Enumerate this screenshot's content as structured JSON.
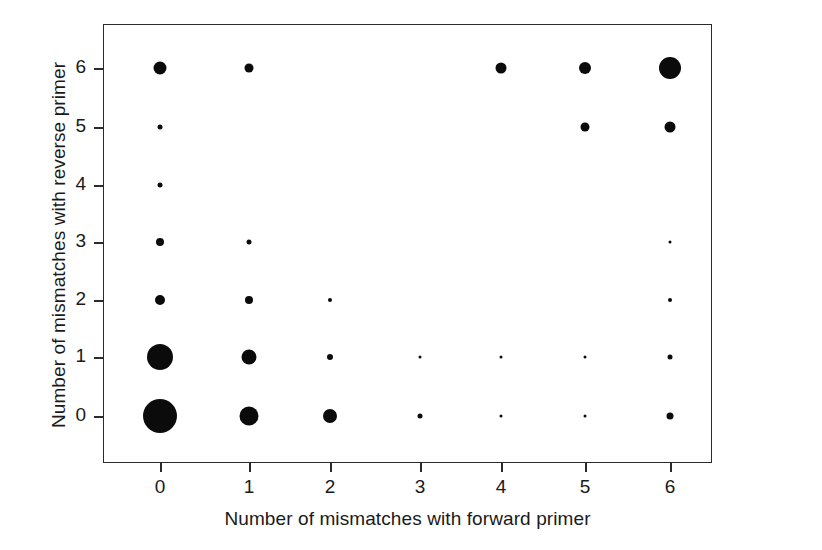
{
  "chart_data": {
    "type": "scatter",
    "title": "",
    "xlabel": "Number of mismatches with forward primer",
    "ylabel": "Number of mismatches with reverse primer",
    "xticks": [
      "0",
      "1",
      "2",
      "3",
      "4",
      "5",
      "6"
    ],
    "yticks": [
      "0",
      "1",
      "2",
      "3",
      "4",
      "5",
      "6"
    ],
    "xlim": [
      -0.65,
      6.45
    ],
    "ylim": [
      -0.75,
      6.6
    ],
    "grid": false,
    "legend": null,
    "marker_color": "#0b0b0b",
    "frame_color": "#2b2b2b",
    "background": "#ffffff",
    "encoding": "marker area proportional to count of sequences at each (forward, reverse) mismatch pair",
    "points": [
      {
        "x": 0,
        "y": 0,
        "size": 34
      },
      {
        "x": 0,
        "y": 1,
        "size": 26
      },
      {
        "x": 0,
        "y": 2,
        "size": 10
      },
      {
        "x": 0,
        "y": 3,
        "size": 8
      },
      {
        "x": 0,
        "y": 4,
        "size": 5
      },
      {
        "x": 0,
        "y": 5,
        "size": 5
      },
      {
        "x": 0,
        "y": 6,
        "size": 13
      },
      {
        "x": 1,
        "y": 0,
        "size": 19
      },
      {
        "x": 1,
        "y": 1,
        "size": 15
      },
      {
        "x": 1,
        "y": 2,
        "size": 8
      },
      {
        "x": 1,
        "y": 3,
        "size": 5
      },
      {
        "x": 1,
        "y": 6,
        "size": 9
      },
      {
        "x": 2,
        "y": 0,
        "size": 14
      },
      {
        "x": 2,
        "y": 1,
        "size": 6
      },
      {
        "x": 2,
        "y": 2,
        "size": 4
      },
      {
        "x": 3,
        "y": 0,
        "size": 5
      },
      {
        "x": 3,
        "y": 1,
        "size": 3
      },
      {
        "x": 4,
        "y": 0,
        "size": 3
      },
      {
        "x": 4,
        "y": 1,
        "size": 3
      },
      {
        "x": 4,
        "y": 6,
        "size": 11
      },
      {
        "x": 5,
        "y": 0,
        "size": 3
      },
      {
        "x": 5,
        "y": 1,
        "size": 3
      },
      {
        "x": 5,
        "y": 5,
        "size": 9
      },
      {
        "x": 5,
        "y": 6,
        "size": 12
      },
      {
        "x": 6,
        "y": 0,
        "size": 7
      },
      {
        "x": 6,
        "y": 1,
        "size": 5
      },
      {
        "x": 6,
        "y": 2,
        "size": 4
      },
      {
        "x": 6,
        "y": 3,
        "size": 3
      },
      {
        "x": 6,
        "y": 5,
        "size": 11
      },
      {
        "x": 6,
        "y": 6,
        "size": 22
      }
    ]
  }
}
